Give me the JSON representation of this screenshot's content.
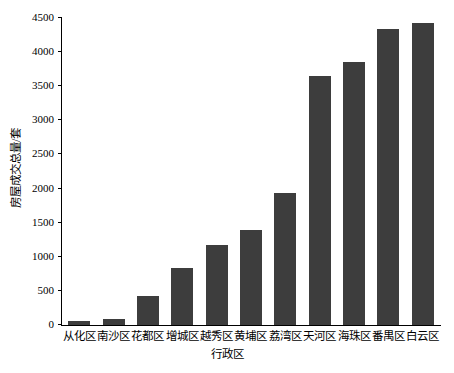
{
  "chart_data": {
    "type": "bar",
    "title": "",
    "xlabel": "行政区",
    "ylabel": "房屋成交总量/套",
    "categories": [
      "从化区",
      "南沙区",
      "花都区",
      "增城区",
      "越秀区",
      "黄埔区",
      "荔湾区",
      "天河区",
      "海珠区",
      "番禺区",
      "白云区"
    ],
    "values": [
      60,
      90,
      425,
      840,
      1170,
      1390,
      1940,
      3650,
      3860,
      4340,
      4430
    ],
    "ylim": [
      0,
      4500
    ],
    "yticks": [
      0,
      500,
      1000,
      1500,
      2000,
      2500,
      3000,
      3500,
      4000,
      4500
    ],
    "ytick_labels": [
      "0",
      "500",
      "1000",
      "1500",
      "2000",
      "2500",
      "3000",
      "3500",
      "4000",
      "4500"
    ],
    "grid": false,
    "legend": null,
    "bar_color": "#3d3d3d",
    "axis_color": "#000000"
  }
}
